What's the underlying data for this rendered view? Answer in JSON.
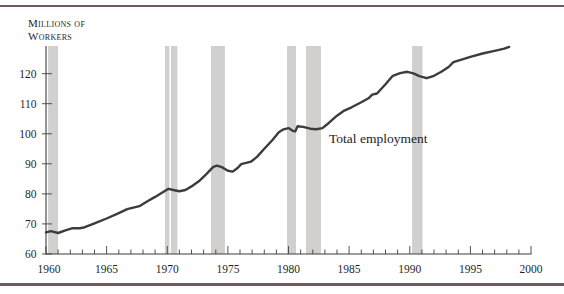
{
  "figure": {
    "y_axis_title_line1": "Millions of",
    "y_axis_title_line2": "Workers"
  },
  "colors": {
    "rule": "#6e5a5c",
    "line": "#3c3b3e",
    "band": "#d2d0cf",
    "band_gap": "#f2f1f0",
    "axis": "#3f3f3f",
    "text": "#1f1f1f"
  },
  "chart_data": {
    "type": "line",
    "title": "",
    "y_axis_title": "Millions of Workers",
    "xlabel": "",
    "ylabel": "Millions of workers",
    "xlim": [
      1960,
      2000
    ],
    "ylim": [
      60,
      129.2
    ],
    "grid": false,
    "legend_position": "inline-annotation",
    "x_ticks": [
      1960,
      1965,
      1970,
      1975,
      1980,
      1985,
      1990,
      1995,
      2000
    ],
    "x_minor_tick_step": 1,
    "y_ticks": [
      60,
      70,
      80,
      90,
      100,
      110,
      120
    ],
    "recession_bands": [
      [
        1960.17,
        1960.99
      ],
      [
        1969.81,
        1970.18
      ],
      [
        1970.31,
        1970.84
      ],
      [
        1973.61,
        1974.76
      ],
      [
        1979.88,
        1980.62
      ],
      [
        1981.44,
        1982.68
      ],
      [
        1990.19,
        1991.05
      ]
    ],
    "series": [
      {
        "name": "Total employment",
        "x": [
          1960.0,
          1960.4,
          1961.0,
          1961.6,
          1962.2,
          1962.8,
          1963.2,
          1964.0,
          1965.0,
          1966.0,
          1966.7,
          1967.2,
          1967.7,
          1968.3,
          1969.0,
          1969.6,
          1970.1,
          1970.5,
          1971.0,
          1971.5,
          1972.0,
          1972.6,
          1973.2,
          1973.8,
          1974.1,
          1974.5,
          1975.0,
          1975.4,
          1975.8,
          1976.1,
          1976.5,
          1976.9,
          1977.4,
          1978.0,
          1978.7,
          1979.2,
          1979.6,
          1980.0,
          1980.35,
          1980.55,
          1980.75,
          1981.2,
          1981.8,
          1982.3,
          1982.8,
          1983.3,
          1984.0,
          1984.6,
          1985.2,
          1986.0,
          1986.6,
          1986.9,
          1987.3,
          1988.0,
          1988.6,
          1989.2,
          1989.8,
          1990.3,
          1990.8,
          1991.4,
          1992.0,
          1992.6,
          1993.2,
          1993.6,
          1994.2,
          1995.0,
          1996.0,
          1997.0,
          1997.8,
          1998.2
        ],
        "y": [
          67.2,
          67.6,
          67.0,
          67.9,
          68.6,
          68.6,
          68.9,
          70.2,
          71.8,
          73.6,
          74.9,
          75.4,
          75.9,
          77.4,
          79.0,
          80.5,
          81.7,
          81.3,
          80.9,
          81.3,
          82.5,
          84.2,
          86.5,
          89.0,
          89.4,
          88.9,
          87.7,
          87.4,
          88.6,
          89.9,
          90.3,
          90.7,
          92.3,
          95.0,
          98.0,
          100.5,
          101.5,
          101.9,
          101.0,
          100.8,
          102.5,
          102.3,
          101.7,
          101.5,
          101.9,
          103.5,
          106.0,
          107.7,
          108.8,
          110.5,
          111.8,
          113.0,
          113.4,
          116.5,
          119.3,
          120.2,
          120.6,
          120.1,
          119.2,
          118.5,
          119.3,
          120.6,
          122.2,
          123.8,
          124.6,
          125.6,
          126.7,
          127.6,
          128.3,
          128.9
        ]
      }
    ]
  }
}
